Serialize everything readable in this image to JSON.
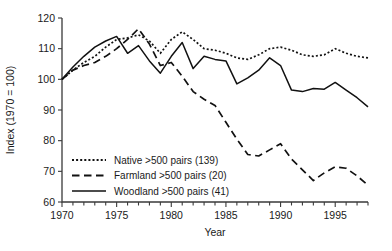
{
  "chart_data": {
    "type": "line",
    "title": "",
    "xlabel": "Year",
    "ylabel": "Index (1970 = 100)",
    "xlim": [
      1970,
      1998
    ],
    "ylim": [
      60,
      120
    ],
    "yticks": [
      60,
      70,
      80,
      90,
      100,
      110,
      120
    ],
    "xticks": [
      1970,
      1975,
      1980,
      1985,
      1990,
      1995
    ],
    "xtick_labels": [
      "1970",
      "1975",
      "1980",
      "1985",
      "1990",
      "1995"
    ],
    "ytick_labels": [
      "60",
      "70",
      "80",
      "90",
      "100",
      "110",
      "120"
    ],
    "xminor_step": 1,
    "grid": false,
    "legend_position": "lower-left",
    "x": [
      1970,
      1971,
      1972,
      1973,
      1974,
      1975,
      1976,
      1977,
      1978,
      1979,
      1980,
      1981,
      1982,
      1983,
      1984,
      1985,
      1986,
      1987,
      1988,
      1989,
      1990,
      1991,
      1992,
      1993,
      1994,
      1995,
      1996,
      1997,
      1998
    ],
    "series": [
      {
        "name": "Native >500 pairs (139)",
        "style": "dotted",
        "values": [
          100,
          103,
          105.5,
          107.5,
          110.5,
          113,
          113.5,
          114.5,
          112.5,
          108.5,
          113,
          115.5,
          113,
          110,
          109.5,
          108.5,
          107,
          106.5,
          108,
          110,
          110.5,
          109.5,
          108,
          107.5,
          108,
          110,
          108.5,
          107.5,
          107
        ]
      },
      {
        "name": "Farmland >500 pairs (20)",
        "style": "dashed",
        "values": [
          100,
          103,
          104.5,
          105.5,
          107.5,
          110,
          113,
          116.5,
          111.5,
          104.5,
          105.5,
          101,
          96,
          93.5,
          91.5,
          86,
          80.5,
          75.5,
          75,
          77,
          79,
          74,
          70.5,
          67,
          69.5,
          71.5,
          71,
          68.5,
          65.5
        ]
      },
      {
        "name": "Woodland >500 pairs (41)",
        "style": "solid",
        "values": [
          100,
          104,
          107.5,
          110.5,
          112.5,
          114,
          108.5,
          111,
          106,
          102,
          107.5,
          112,
          103.5,
          107.5,
          106.5,
          106,
          98.5,
          100.5,
          103,
          107,
          104.5,
          96.5,
          96,
          97,
          96.8,
          99,
          96.5,
          94,
          91
        ]
      }
    ]
  }
}
